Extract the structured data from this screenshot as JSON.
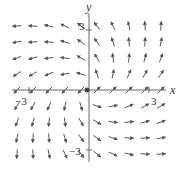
{
  "chart_data": {
    "type": "vector_field",
    "title": "",
    "field": {
      "u": "x - y",
      "v": "x + y"
    },
    "xlabel": "x",
    "ylabel": "y",
    "xlim": [
      -4,
      4
    ],
    "ylim": [
      -4,
      4
    ],
    "tick_labels": {
      "x": [
        "-3",
        "3"
      ],
      "y": [
        "3",
        "-3"
      ]
    },
    "grid_spacing": 0.8,
    "arrow_color": "#555555",
    "axis_color": "#666666",
    "origin_marker": true,
    "grid": false,
    "legend": null
  },
  "labels": {
    "x_axis": "x",
    "y_axis": "y",
    "x_tick_neg": "−3",
    "x_tick_pos": "3",
    "y_tick_pos": "3",
    "y_tick_neg": "−3"
  }
}
